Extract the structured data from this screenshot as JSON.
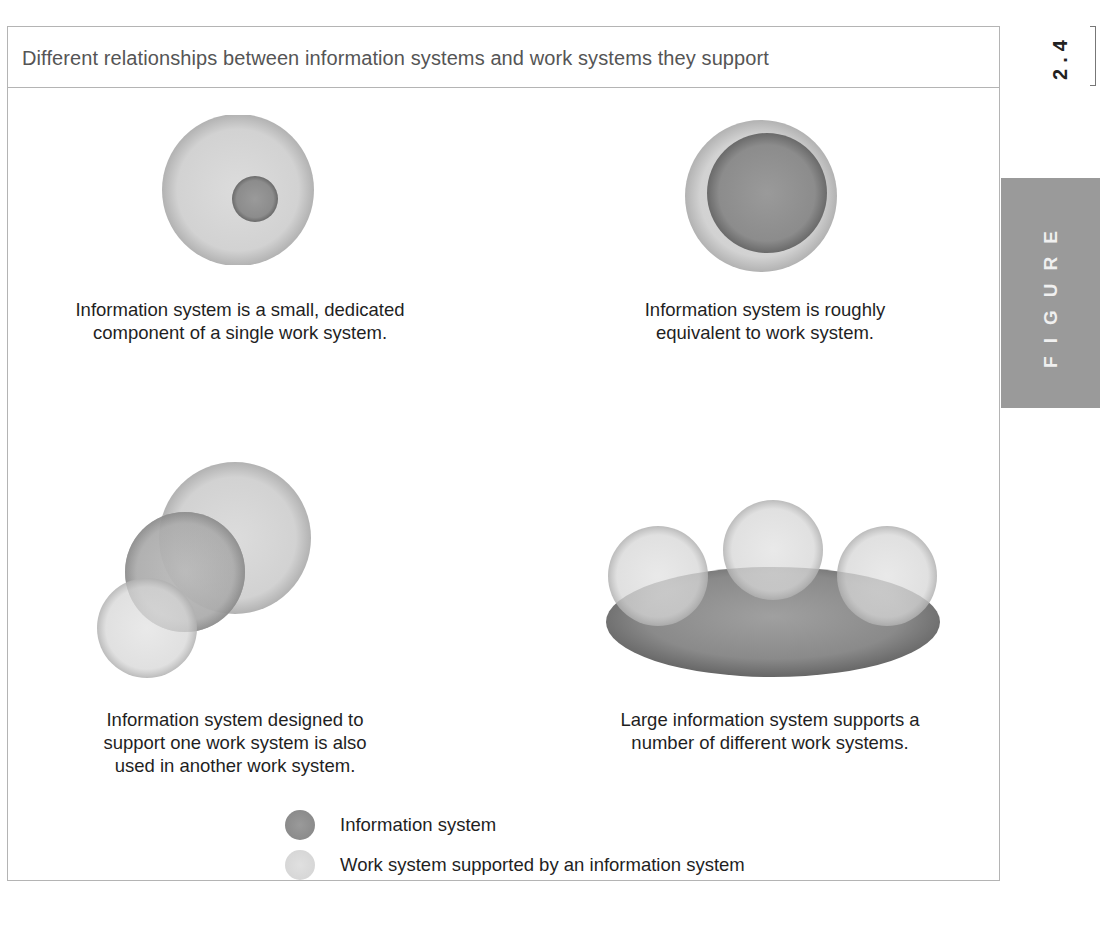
{
  "figure": {
    "number": "2.4",
    "tab_label": "FIGURE",
    "title": "Different relationships between information systems and work systems they support"
  },
  "colors": {
    "information_system": "#8a8a8a",
    "information_system_dark": "#6f6f6f",
    "work_system": "#d4d4d4",
    "work_system_edge": "#b3b3b3",
    "border": "#b4b4b4",
    "tab_bg": "#9a9a9a",
    "title_text": "#555555"
  },
  "panels": [
    {
      "id": "small-dedicated",
      "caption_lines": [
        "Information system is a small, dedicated",
        "component of a single work system."
      ]
    },
    {
      "id": "roughly-equivalent",
      "caption_lines": [
        "Information system is roughly",
        "equivalent to work system."
      ]
    },
    {
      "id": "shared-across-two",
      "caption_lines": [
        "Information system designed to",
        "support one work system is also",
        "used in another work system."
      ]
    },
    {
      "id": "large-supports-many",
      "caption_lines": [
        "Large information system supports a",
        "number of different work systems."
      ]
    }
  ],
  "legend": {
    "items": [
      {
        "icon": "information-system-swatch",
        "label": "Information system"
      },
      {
        "icon": "work-system-swatch",
        "label": "Work system supported by an information system"
      }
    ]
  }
}
